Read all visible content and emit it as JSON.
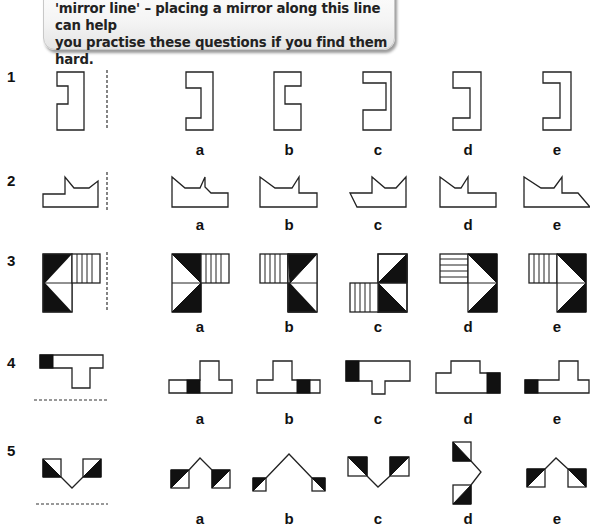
{
  "intro": {
    "line1": "'mirror line' – placing a mirror along this line can help",
    "line2": "you practise these questions if you find them hard."
  },
  "questions": [
    {
      "number": "1",
      "mirror": "vertical",
      "options": [
        "a",
        "b",
        "c",
        "d",
        "e"
      ]
    },
    {
      "number": "2",
      "mirror": "vertical",
      "options": [
        "a",
        "b",
        "c",
        "d",
        "e"
      ]
    },
    {
      "number": "3",
      "mirror": "vertical",
      "options": [
        "a",
        "b",
        "c",
        "d",
        "e"
      ]
    },
    {
      "number": "4",
      "mirror": "horizontal",
      "options": [
        "a",
        "b",
        "c",
        "d",
        "e"
      ]
    },
    {
      "number": "5",
      "mirror": "horizontal",
      "options": [
        "a",
        "b",
        "c",
        "d",
        "e"
      ]
    }
  ],
  "colors": {
    "ink": "#111111",
    "banner_bg": "#f2f2f2"
  }
}
